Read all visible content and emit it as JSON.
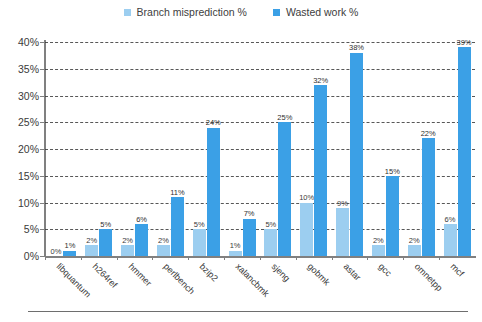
{
  "legend": {
    "position": "top-center",
    "entries": [
      {
        "label": "Branch misprediction %",
        "color": "#9ccef0",
        "icon": "square-swatch-icon"
      },
      {
        "label": "Wasted work %",
        "color": "#3ba0e6",
        "icon": "square-swatch-icon"
      }
    ]
  },
  "axes": {
    "y_ticks": [
      "0%",
      "5%",
      "10%",
      "15%",
      "20%",
      "25%",
      "30%",
      "35%",
      "40%"
    ]
  },
  "chart_data": {
    "type": "bar",
    "title": "",
    "subtitle": "",
    "xlabel": "",
    "ylabel": "",
    "ylim": [
      0,
      40
    ],
    "ytick_step": 5,
    "ytick_format": "percent",
    "grid": true,
    "grid_style": "dashed-horizontal",
    "legend_position": "top-center",
    "categories": [
      "libquantum",
      "h264ref",
      "hmmer",
      "perlbench",
      "bzip2",
      "xalancbmk",
      "sjeng",
      "gobmk",
      "astar",
      "gcc",
      "omnetpp",
      "mcf"
    ],
    "series": [
      {
        "name": "Branch misprediction %",
        "color": "#9ccef0",
        "values": [
          0,
          2,
          2,
          2,
          5,
          1,
          5,
          10,
          9,
          2,
          2,
          6
        ],
        "labels": [
          "0%",
          "2%",
          "2%",
          "2%",
          "5%",
          "1%",
          "5%",
          "10%",
          "9%",
          "2%",
          "2%",
          "6%"
        ]
      },
      {
        "name": "Wasted work %",
        "color": "#3ba0e6",
        "values": [
          1,
          5,
          6,
          11,
          24,
          7,
          25,
          32,
          38,
          15,
          22,
          39
        ],
        "labels": [
          "1%",
          "5%",
          "6%",
          "11%",
          "24%",
          "7%",
          "25%",
          "32%",
          "38%",
          "15%",
          "22%",
          "39%"
        ]
      }
    ]
  }
}
